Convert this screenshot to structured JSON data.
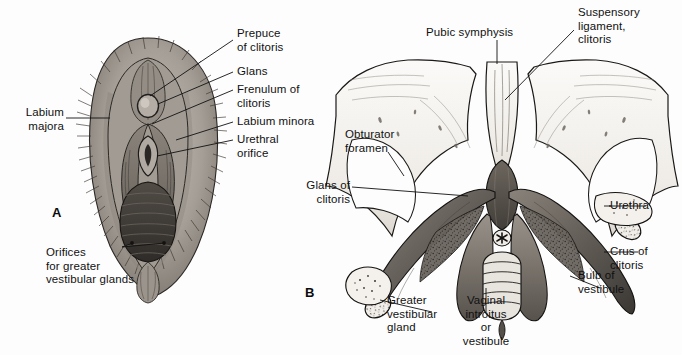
{
  "figure": {
    "background_color": "#fdfdfd",
    "ink_color": "#111111",
    "panels": [
      {
        "letter": "A",
        "x": 52,
        "y": 205
      },
      {
        "letter": "B",
        "x": 305,
        "y": 285
      }
    ]
  },
  "panel_a": {
    "letter": "A",
    "title": "External female genitalia",
    "labels": {
      "labium_majora": "Labium\nmajora",
      "prepuce_of_clitoris": "Prepuce\nof clitoris",
      "glans": "Glans",
      "frenulum_of_clitoris": "Frenulum of\nclitoris",
      "labium_minora": "Labium minora",
      "urethral_orifice": "Urethral\norifice",
      "orifices_for_greater_vestibular_glands": "Orifices\nfor greater\nvestibular glands"
    }
  },
  "panel_b": {
    "letter": "B",
    "title": "Deep structures of the female perineum",
    "labels": {
      "pubic_symphysis": "Pubic symphysis",
      "suspensory_ligament_clitoris": "Suspensory\nligament,\nclitoris",
      "obturator_foramen": "Obturator\nforamen",
      "glans_of_clitoris": "Glans of\nclitoris",
      "urethra": "Urethra",
      "crus_of_clitoris": "Crus of\nclitoris",
      "bulb_of_vestibule": "Bulb of\nvestibule",
      "greater_vestibular_gland": "Greater\nvestibular\ngland",
      "vaginal_introitus_or_vestibule": "Vaginal\nintroitus\nor\nvestibule"
    }
  },
  "colors": {
    "bone_light": "#f6f4f1",
    "bone_shade": "#d9d5cf",
    "tissue_mid": "#8d8780",
    "tissue_dark": "#4a4641",
    "tissue_darkest": "#2b2926",
    "skin_light": "#bdb6ae",
    "skin_mid": "#9a938b",
    "outline": "#1a1a1a"
  }
}
